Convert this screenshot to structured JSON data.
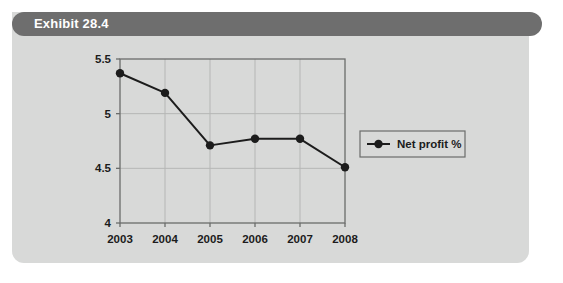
{
  "card": {
    "title": "Exhibit 28.4",
    "background_color": "#d8d9d8",
    "title_bar_color": "#6e6e6e",
    "title_text_color": "#ffffff"
  },
  "chart_data": {
    "type": "line",
    "title": "",
    "subtitle": "",
    "xlabel": "",
    "ylabel": "",
    "categories": [
      "2003",
      "2004",
      "2005",
      "2006",
      "2007",
      "2008"
    ],
    "series": [
      {
        "name": "Net profit %",
        "values": [
          5.37,
          5.19,
          4.71,
          4.77,
          4.77,
          4.51
        ],
        "color": "#1c1c1c",
        "marker": "circle"
      }
    ],
    "ylim": [
      4,
      5.5
    ],
    "yticks": [
      "4",
      "4.5",
      "5",
      "5.5"
    ],
    "ytick_values": [
      4,
      4.5,
      5,
      5.5
    ],
    "xticks": [
      "2003",
      "2004",
      "2005",
      "2006",
      "2007",
      "2008"
    ],
    "grid": true,
    "grid_color": "#b5b6b5",
    "plot_background": "#d8d9d8",
    "axis_color": "#6b6c6b",
    "legend_position": "right",
    "legend_entries": [
      "Net profit %"
    ]
  }
}
